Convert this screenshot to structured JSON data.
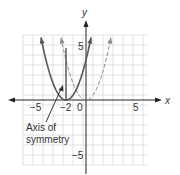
{
  "chart_data": {
    "type": "line",
    "title": "",
    "xlabel": "x",
    "ylabel": "y",
    "xlim": [
      -6.3,
      6.1
    ],
    "ylim": [
      -6.5,
      6.5
    ],
    "grid": true,
    "x_ticks": [
      {
        "value": -5,
        "label": "−5"
      },
      {
        "value": -2,
        "label": "−2"
      },
      {
        "value": 0,
        "label": "0"
      },
      {
        "value": 5,
        "label": "5"
      }
    ],
    "y_ticks": [
      {
        "value": 5,
        "label": "5"
      },
      {
        "value": -5,
        "label": "−5"
      }
    ],
    "series": [
      {
        "name": "y = (x + 2)^2",
        "style": "solid",
        "x_range": [
          -4.5,
          0.5
        ],
        "vertex": [
          -2,
          0
        ],
        "color": "#555555"
      },
      {
        "name": "y = x^2",
        "style": "dashed",
        "x_range": [
          -2.5,
          2.5
        ],
        "vertex": [
          0,
          0
        ],
        "color": "#888888"
      }
    ],
    "axis_of_symmetry": {
      "x": -2,
      "y_range": [
        0,
        5.2
      ]
    },
    "annotations": [
      {
        "text": "Axis of symmetry",
        "lines": [
          "Axis of",
          "symmetry"
        ],
        "points_to": [
          -2.3,
          1.4
        ]
      }
    ]
  }
}
